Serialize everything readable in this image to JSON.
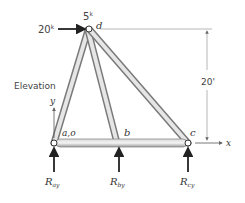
{
  "title": "Elevation",
  "loads": {
    "horizontal": "20",
    "horizontal_unit": "k",
    "vertical": "5",
    "vertical_unit": "k"
  },
  "joints": {
    "a": "a,o",
    "b": "b",
    "c": "c",
    "d": "d"
  },
  "axes": {
    "x": "x",
    "y": "y"
  },
  "dimension": {
    "height": "20'"
  },
  "reactions": {
    "a": {
      "main": "R",
      "sub": "ay"
    },
    "b": {
      "main": "R",
      "sub": "by"
    },
    "c": {
      "main": "R",
      "sub": "cy"
    }
  },
  "colors": {
    "member": "#b8b8b8",
    "member_edge": "#7a7a7a",
    "arrow": "#222222",
    "dim_line": "#999999"
  }
}
